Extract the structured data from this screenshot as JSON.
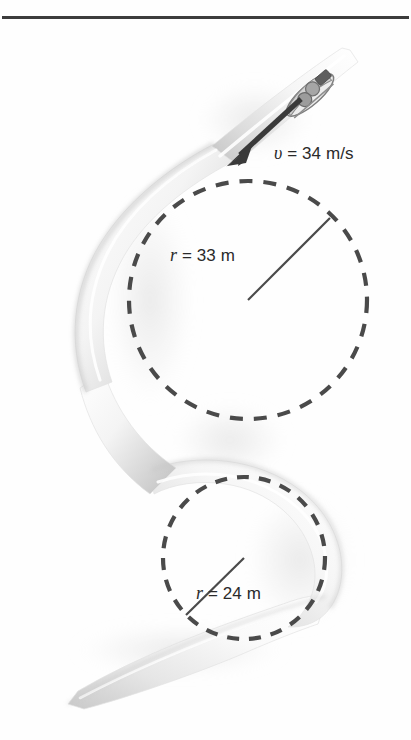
{
  "figure": {
    "type": "physics-diagram",
    "background_color": "#fefefe",
    "width": 411,
    "height": 740
  },
  "top_rule": {
    "name": "horizontal-rule",
    "color": "#3c3c3c",
    "y": 17,
    "x_start": 2,
    "x_end": 409,
    "thickness": 3
  },
  "labels": {
    "velocity": {
      "symbol": "υ",
      "equals": " = ",
      "value": "34",
      "unit": " m/s",
      "full": "υ = 34 m/s"
    },
    "radius_upper": {
      "symbol": "r",
      "equals": " = ",
      "value": "33",
      "unit": " m",
      "full": "r = 33 m"
    },
    "radius_lower": {
      "symbol": "r",
      "equals": " = ",
      "value": "24",
      "unit": " m",
      "full": "r = 24 m"
    }
  },
  "circles": {
    "upper": {
      "name": "upper-curve-radius-circle",
      "center_x": 248,
      "center_y": 300,
      "radius": 119,
      "stroke": "#4a4a4a",
      "style": "dashed",
      "radius_line": {
        "x1": 248,
        "y1": 300,
        "x2": 330,
        "y2": 218
      }
    },
    "lower": {
      "name": "lower-curve-radius-circle",
      "center_x": 244,
      "center_y": 558,
      "radius": 81,
      "stroke": "#4a4a4a",
      "style": "dashed",
      "radius_line": {
        "x1": 244,
        "y1": 558,
        "x2": 186,
        "y2": 615
      }
    }
  },
  "track": {
    "name": "bobsled-track-ribbon",
    "fill_light": "#fdfdfd",
    "fill_mid": "#e8e8e8",
    "fill_shadow": "#b9b9b9",
    "entry_point": {
      "x": 350,
      "y": 52
    },
    "exit_point": {
      "x": 68,
      "y": 703
    }
  },
  "velocity_arrow": {
    "name": "velocity-arrow",
    "color": "#3a3a3a",
    "tail": {
      "x": 300,
      "y": 100
    },
    "tip": {
      "x": 228,
      "y": 166
    },
    "direction": "down-left"
  },
  "bobsled": {
    "name": "bobsled-with-riders",
    "body_color": "#d8d8d8",
    "rider_color": "#9a9a9a",
    "position": {
      "x": 310,
      "y": 95
    },
    "rider_count": 2
  }
}
